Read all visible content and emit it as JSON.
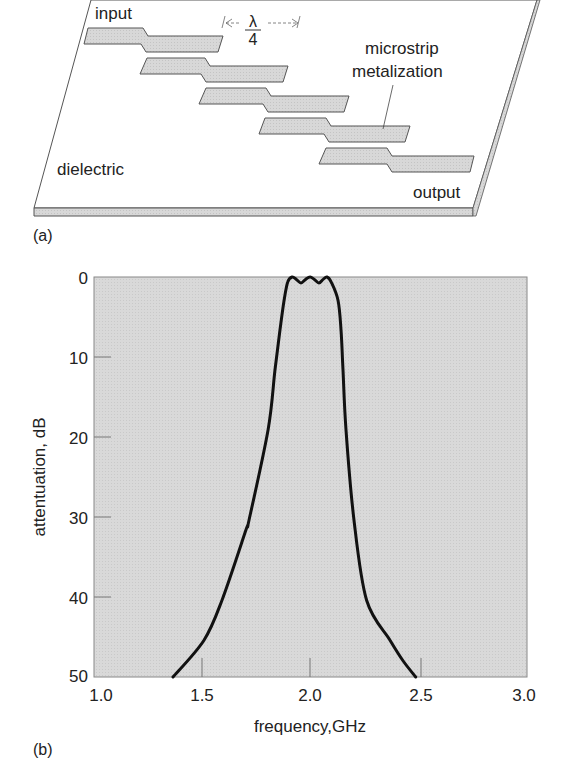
{
  "figure_a": {
    "panel_label": "(a)",
    "labels": {
      "input": "input",
      "output": "output",
      "dielectric_line1": "dielectric",
      "dielectric_line2": "substrate",
      "microstrip_line1": "microstrip",
      "metalization_line2": "metalization",
      "lambda_numerator": "λ",
      "lambda_denominator": "4"
    },
    "colors": {
      "metal": "#d4d4d4",
      "substrate_edge": "#d0d0d0",
      "line": "#444444"
    }
  },
  "figure_b": {
    "panel_label": "(b)",
    "colors": {
      "plot_bg": "#d6d6d6",
      "curve": "#111111",
      "axis": "#777777"
    }
  },
  "chart_data": {
    "type": "line",
    "title": "",
    "xlabel": "frequency,GHz",
    "ylabel": "attentuation, dB",
    "xlim": [
      1.0,
      3.0
    ],
    "ylim": [
      0,
      50
    ],
    "y_inverted": true,
    "grid": false,
    "x_ticks": [
      "1.0",
      "1.5",
      "2.0",
      "2.5",
      "3.0"
    ],
    "y_ticks": [
      "0",
      "10",
      "20",
      "30",
      "40",
      "50"
    ],
    "series": [
      {
        "name": "bandpass filter response",
        "x": [
          1.365,
          1.508,
          1.591,
          1.702,
          1.716,
          1.804,
          1.836,
          1.859,
          1.878,
          1.895,
          1.915,
          1.935,
          1.956,
          1.977,
          1.998,
          2.018,
          2.039,
          2.058,
          2.076,
          2.095,
          2.127,
          2.141,
          2.15,
          2.164,
          2.201,
          2.259,
          2.367,
          2.428,
          2.486
        ],
        "values": [
          50,
          45.4,
          40.4,
          31.6,
          30.4,
          19.1,
          11.6,
          6.6,
          2.9,
          0.6,
          0,
          0.3,
          0.75,
          0.3,
          0,
          0.3,
          0.75,
          0.3,
          0,
          0.6,
          2.9,
          6.6,
          11.6,
          19.1,
          30.4,
          40.4,
          45.4,
          48.0,
          50
        ]
      }
    ]
  }
}
